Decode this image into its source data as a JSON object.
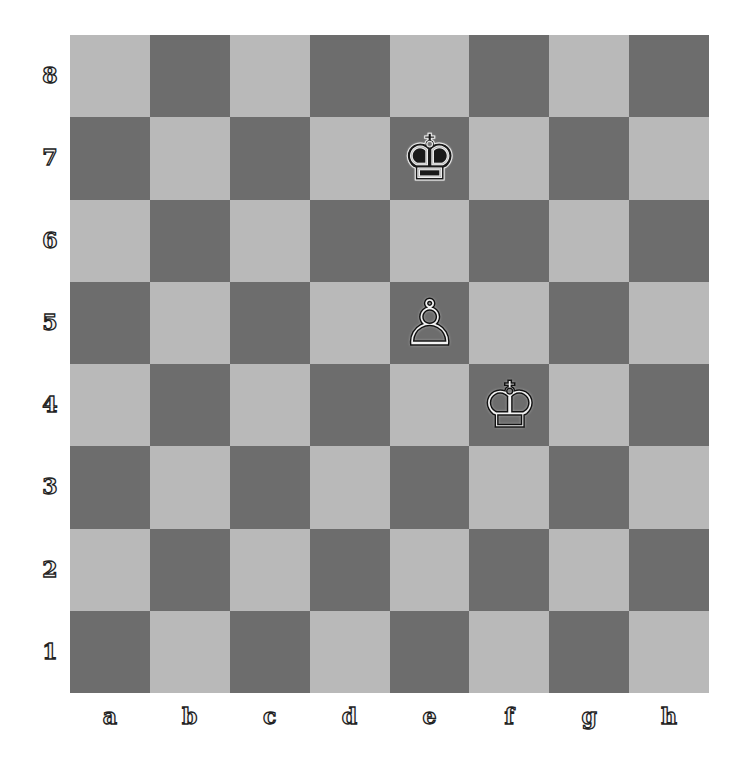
{
  "board": {
    "files": [
      "a",
      "b",
      "c",
      "d",
      "e",
      "f",
      "g",
      "h"
    ],
    "ranks": [
      "8",
      "7",
      "6",
      "5",
      "4",
      "3",
      "2",
      "1"
    ],
    "colors": {
      "light": "#b9b9b9",
      "dark": "#6d6d6d"
    },
    "pieces": [
      {
        "square": "e7",
        "color": "black",
        "type": "king",
        "glyph": "♚"
      },
      {
        "square": "e5",
        "color": "white",
        "type": "pawn",
        "glyph": "♙"
      },
      {
        "square": "f4",
        "color": "white",
        "type": "king",
        "glyph": "♔"
      }
    ]
  }
}
